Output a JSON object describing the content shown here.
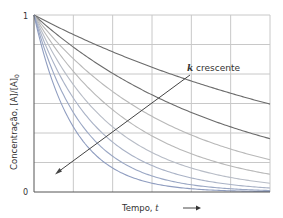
{
  "chart_data": {
    "type": "line",
    "title": "",
    "xlabel": "Tempo, t",
    "ylabel": "Concentração, [A]/[A]0",
    "ylabel_main": "Concentração, [A]/[A]",
    "ylabel_sub": "0",
    "xlabel_main": "Tempo, ",
    "xlabel_var": "t",
    "y_ticks": [
      "0",
      "1"
    ],
    "ylim": [
      0,
      1
    ],
    "xlim": [
      0,
      1
    ],
    "grid": true,
    "grid_columns": 6,
    "grid_rows": 6,
    "annotation": {
      "k": "k",
      "text": " crescente"
    },
    "series": [
      {
        "name": "k1",
        "k": 0.7,
        "color": "#6b6b6b"
      },
      {
        "name": "k2",
        "k": 1.2,
        "color": "#6b6b6b"
      },
      {
        "name": "k3",
        "k": 1.7,
        "color": "#b8b8b8"
      },
      {
        "name": "k4",
        "k": 2.3,
        "color": "#b8b8b8"
      },
      {
        "name": "k5",
        "k": 3.0,
        "color": "#b7bcc6"
      },
      {
        "name": "k6",
        "k": 3.8,
        "color": "#a9b2c6"
      },
      {
        "name": "k7",
        "k": 4.8,
        "color": "#9aa7c4"
      },
      {
        "name": "k8",
        "k": 6.0,
        "color": "#8f9dc0"
      }
    ]
  }
}
